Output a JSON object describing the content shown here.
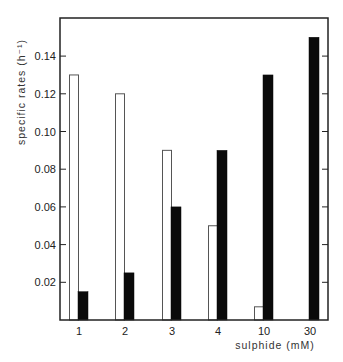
{
  "chart_data": {
    "type": "bar",
    "title": "",
    "xlabel": "sulphide (mM)",
    "ylabel": "specific rates (h⁻¹)",
    "categories": [
      "1",
      "2",
      "3",
      "4",
      "10",
      "30"
    ],
    "series": [
      {
        "name": "open bars",
        "fill": "#ffffff",
        "stroke": "#555555",
        "values": [
          0.13,
          0.12,
          0.09,
          0.05,
          0.007,
          0
        ]
      },
      {
        "name": "filled bars",
        "fill": "#0a0a0a",
        "stroke": "#0a0a0a",
        "values": [
          0.015,
          0.025,
          0.06,
          0.09,
          0.13,
          0.15
        ]
      }
    ],
    "ylim": [
      0,
      0.16
    ],
    "yticks": [
      0.02,
      0.04,
      0.06,
      0.08,
      0.1,
      0.12,
      0.14
    ],
    "ytick_labels": [
      "0.02",
      "0.04",
      "0.06",
      "0.08",
      "0.10",
      "0.12",
      "0.14"
    ],
    "grid": false,
    "legend": null
  },
  "colors": {
    "axis": "#222222",
    "open_bar_stroke": "#555555",
    "filled_bar": "#0a0a0a"
  }
}
